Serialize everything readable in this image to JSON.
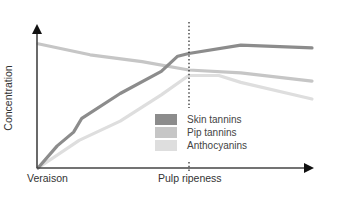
{
  "chart_data": {
    "type": "line",
    "title": "",
    "xlabel": "",
    "ylabel": "Concentration",
    "x_annotations": [
      {
        "label": "Veraison",
        "position": 0
      },
      {
        "label": "Pulp ripeness",
        "position": 0.55,
        "marker": "dotted-vertical-line"
      }
    ],
    "grid": false,
    "legend_position": "lower-center-right",
    "series": [
      {
        "name": "Skin tannins",
        "color": "#8c8c8c",
        "points": [
          [
            0,
            0
          ],
          [
            0.07,
            0.16
          ],
          [
            0.13,
            0.26
          ],
          [
            0.16,
            0.36
          ],
          [
            0.3,
            0.54
          ],
          [
            0.45,
            0.7
          ],
          [
            0.51,
            0.81
          ],
          [
            0.55,
            0.83
          ],
          [
            0.74,
            0.89
          ],
          [
            1.0,
            0.87
          ]
        ]
      },
      {
        "name": "Pip tannins",
        "color": "#c6c6c6",
        "points": [
          [
            0,
            0.9
          ],
          [
            0.19,
            0.82
          ],
          [
            0.38,
            0.77
          ],
          [
            0.55,
            0.71
          ],
          [
            0.74,
            0.69
          ],
          [
            1.0,
            0.63
          ]
        ]
      },
      {
        "name": "Anthocyanins",
        "color": "#dedede",
        "points": [
          [
            0,
            0
          ],
          [
            0.15,
            0.2
          ],
          [
            0.3,
            0.34
          ],
          [
            0.45,
            0.53
          ],
          [
            0.55,
            0.67
          ],
          [
            0.66,
            0.67
          ],
          [
            0.74,
            0.62
          ],
          [
            1.0,
            0.5
          ]
        ]
      }
    ]
  },
  "labels": {
    "ylabel": "Concentration",
    "x_start": "Veraison",
    "x_mid": "Pulp ripeness"
  },
  "legend": [
    {
      "label": "Skin tannins",
      "color": "#8c8c8c"
    },
    {
      "label": "Pip tannins",
      "color": "#c6c6c6"
    },
    {
      "label": "Anthocyanins",
      "color": "#dedede"
    }
  ]
}
